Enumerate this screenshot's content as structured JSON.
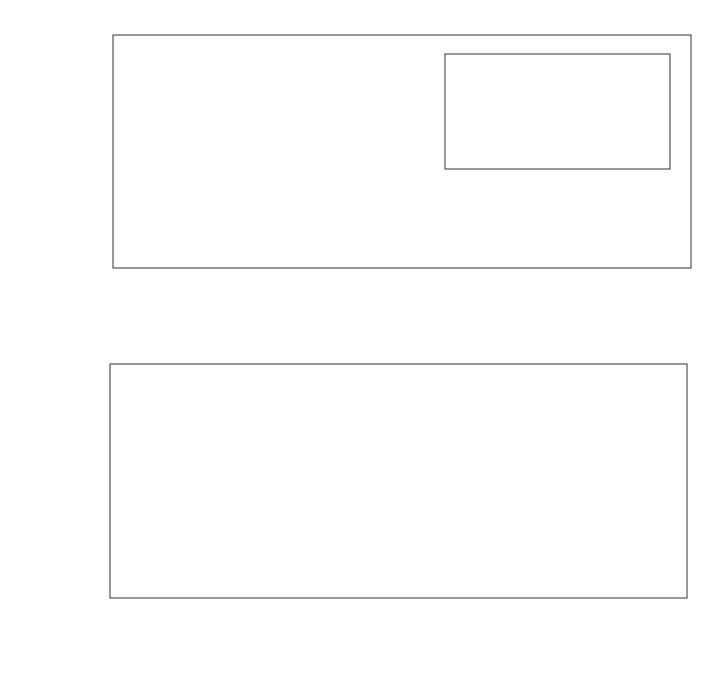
{
  "chart_data": [
    {
      "id": "top",
      "type": "line",
      "title": "",
      "xlabel": "a_BF [nm]",
      "xlabel_main": "a",
      "xlabel_sub": "BF",
      "xlabel_unit": "[nm]",
      "ylabel": "κ",
      "xlim": [
        -4,
        6
      ],
      "ylim": [
        0,
        2.6
      ],
      "xticks": [
        -4,
        -2,
        0,
        2,
        4,
        6
      ],
      "xtick_labels": [
        "−4",
        "−2",
        "0",
        "2",
        "4",
        "6"
      ],
      "yticks": [
        0,
        1,
        2
      ],
      "ytick_labels": [
        "0",
        "1",
        "2"
      ],
      "grid": false,
      "marker": "open-circle",
      "series": [
        {
          "name": "kappa",
          "x": [
            -4,
            -3.5,
            -3,
            -2.5,
            -2,
            -1.5,
            -1,
            -0.5,
            -0.25,
            0,
            0.1,
            0.2,
            0.3,
            0.4,
            0.5,
            0.6,
            0.7,
            0.8,
            0.9,
            1.0,
            1.1,
            1.2,
            1.3,
            1.4,
            1.5,
            1.6,
            1.7,
            1.8,
            1.9,
            2.0,
            2.2,
            2.4,
            2.6,
            2.8,
            3.0,
            3.2,
            3.4,
            3.6,
            3.8,
            4.0,
            4.2,
            4.4,
            4.6,
            4.8,
            5.0,
            5.2,
            5.4,
            5.6,
            5.8,
            6.0
          ],
          "y": [
            0.01,
            0.01,
            0.01,
            0.015,
            0.02,
            0.03,
            0.06,
            0.15,
            0.3,
            1.0,
            1.88,
            2.42,
            2.48,
            1.88,
            1.18,
            1.0,
            0.92,
            0.87,
            0.83,
            0.8,
            0.78,
            0.76,
            0.75,
            0.74,
            0.73,
            0.72,
            0.715,
            0.71,
            0.705,
            0.7,
            0.69,
            0.685,
            0.68,
            0.675,
            0.67,
            0.668,
            0.665,
            0.662,
            0.66,
            0.658,
            0.656,
            0.654,
            0.652,
            0.65,
            0.649,
            0.648,
            0.647,
            0.646,
            0.645,
            0.644
          ]
        }
      ],
      "inset": {
        "type": "line",
        "xlim": [
          -4,
          0
        ],
        "xticks": [
          -4,
          -2,
          0
        ],
        "xtick_labels": [
          "−4",
          "−2",
          "0"
        ],
        "yscale": "log",
        "ytick_labels": [
          {
            "base": "10",
            "exp": "0"
          },
          {
            "base": "10",
            "exp": "1"
          },
          {
            "base": "10",
            "exp": "2"
          }
        ],
        "line_style": "dashed",
        "marker": "filled-circle",
        "series": [
          {
            "name": "kappa_log",
            "x": [
              -4,
              -3.5,
              -3,
              -2.5,
              -2,
              -1.5,
              -1,
              -0.5,
              -0.25,
              0
            ],
            "log_position_from_top": [
              1.99,
              1.88,
              1.78,
              1.66,
              1.53,
              1.37,
              1.13,
              0.78,
              0.52,
              0.0
            ]
          }
        ]
      }
    },
    {
      "id": "bottom",
      "type": "line",
      "title": "",
      "xlabel": "a_BF [nm]",
      "xlabel_main": "a",
      "xlabel_sub": "BF",
      "xlabel_unit": "[nm]",
      "ylabel": "κ",
      "xlim": [
        -4,
        4
      ],
      "ylim": [
        0,
        1.5
      ],
      "xticks": [
        -4,
        -2,
        0,
        2,
        4
      ],
      "xtick_labels": [
        "−4",
        "−2",
        "0",
        "2",
        "4"
      ],
      "yticks": [
        0,
        0.5,
        1,
        1.5
      ],
      "ytick_labels": [
        "0",
        "0.5",
        "1",
        "1.5"
      ],
      "grid": false,
      "marker": "open-circle",
      "series": [
        {
          "name": "kappa",
          "x": [
            -4,
            -3.5,
            -3,
            -2.5,
            -2,
            -1.5,
            -1.25,
            -1.0,
            -0.8,
            -0.6,
            -0.4,
            -0.2,
            0,
            0.05,
            0.1,
            0.2,
            0.3,
            0.4,
            0.5,
            0.6,
            0.7,
            0.8,
            0.9,
            1.0,
            1.1,
            1.2,
            1.3,
            1.4,
            1.5,
            1.6,
            1.7,
            1.8,
            1.9,
            2.0,
            2.2,
            2.4,
            2.6,
            2.8,
            3.0,
            3.2,
            3.4,
            3.6,
            3.8,
            4.0
          ],
          "y": [
            0.0,
            0.005,
            0.008,
            0.02,
            0.09,
            0.27,
            0.39,
            0.52,
            0.69,
            0.75,
            0.83,
            0.92,
            1.0,
            1.03,
            1.05,
            1.08,
            1.1,
            1.12,
            1.13,
            1.145,
            1.145,
            1.14,
            1.11,
            1.08,
            1.05,
            1.03,
            1.01,
            1.0,
            0.98,
            0.97,
            0.96,
            0.955,
            0.95,
            0.945,
            0.935,
            0.93,
            0.925,
            0.92,
            0.915,
            0.91,
            0.905,
            0.905,
            0.9,
            0.9
          ]
        }
      ]
    }
  ]
}
